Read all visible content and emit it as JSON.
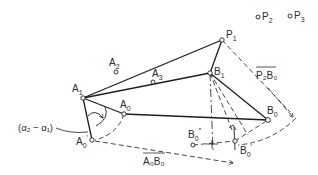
{
  "diagram": {
    "type": "four-bar linkage synthesis construction",
    "points": [
      {
        "id": "P1",
        "label": "P",
        "sub": "1",
        "x": 222,
        "y": 40
      },
      {
        "id": "P2",
        "label": "P",
        "sub": "2",
        "x": 257,
        "y": 16
      },
      {
        "id": "P3",
        "label": "P",
        "sub": "3",
        "x": 290,
        "y": 15
      },
      {
        "id": "A1",
        "label": "A",
        "sub": "1",
        "x": 83,
        "y": 98
      },
      {
        "id": "A2",
        "label": "A",
        "sub": "2",
        "x": 116,
        "y": 72
      },
      {
        "id": "A3",
        "label": "A",
        "sub": "3",
        "x": 153,
        "y": 82
      },
      {
        "id": "B1",
        "label": "B",
        "sub": "1",
        "x": 210,
        "y": 73
      },
      {
        "id": "A0",
        "label": "A",
        "sub": "0",
        "x": 124,
        "y": 114
      },
      {
        "id": "A0p",
        "label": "A",
        "sub": "0",
        "prime": "′",
        "x": 92,
        "y": 140
      },
      {
        "id": "B0",
        "label": "B",
        "sub": "0",
        "x": 268,
        "y": 120
      },
      {
        "id": "B0pp",
        "label": "B",
        "sub": "0",
        "prime": "″",
        "x": 193,
        "y": 145
      },
      {
        "id": "B0p",
        "label": "B",
        "sub": "0",
        "prime": "′",
        "x": 235,
        "y": 141
      }
    ],
    "annotations": {
      "angle": "(α₂ − α₁)",
      "segment_p2b0": "P₂B₀",
      "segment_a0b0": "A₀B₀"
    },
    "labels": {
      "P": "P",
      "A": "A",
      "B": "B",
      "s0": "0",
      "s1": "1",
      "s2": "2",
      "s3": "3",
      "prime": "′",
      "dprime": "″"
    }
  }
}
